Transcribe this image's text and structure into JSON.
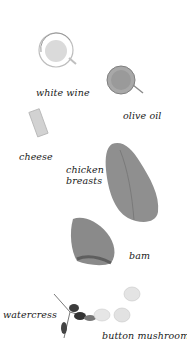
{
  "ingredients": [
    {
      "id": "white-wine",
      "label": "white wine"
    },
    {
      "id": "olive-oil",
      "label": "olive oil"
    },
    {
      "id": "cheese",
      "label": "cheese"
    },
    {
      "id": "chicken-breasts",
      "label_line1": "chicken",
      "label_line2": "breasts"
    },
    {
      "id": "ham",
      "label": "bam"
    },
    {
      "id": "watercress",
      "label": "watercress"
    },
    {
      "id": "button-mushrooms",
      "label": "button mushrooms"
    }
  ],
  "colors": {
    "background": "#ffffff",
    "text": "#1a1a1a",
    "glass": "#c8c8c8",
    "olive_oil": "#9a9a9a",
    "cheese": "#cfcfcf",
    "chicken": "#8f8f8f",
    "ham": "#8a8a8a",
    "watercress": "#3c3c3c",
    "mushroom": "#e4e4e4"
  }
}
